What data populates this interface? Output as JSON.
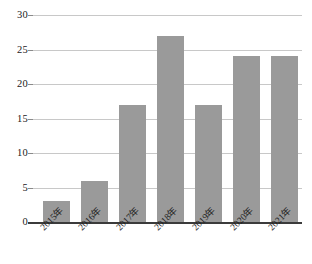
{
  "chart_data": {
    "type": "bar",
    "title": "",
    "subtitle": "",
    "xlabel": "",
    "ylabel": "",
    "categories": [
      "2015年",
      "2016年",
      "2017年",
      "2018年",
      "2019年",
      "2020年",
      "2021年"
    ],
    "values": [
      3,
      6,
      17,
      27,
      17,
      24,
      24
    ],
    "ylim": [
      0,
      30
    ],
    "ytick_labels": [
      "0",
      "5",
      "10",
      "15",
      "20",
      "25",
      "30"
    ],
    "ytick_values": [
      0,
      5,
      10,
      15,
      20,
      25,
      30
    ],
    "grid": "horizontal",
    "legend": "none",
    "series": [
      {
        "name": "",
        "values": [
          3,
          6,
          17,
          27,
          17,
          24,
          24
        ]
      }
    ],
    "annotations": [],
    "colors": {
      "bar_fill": "#9a9a9a",
      "gridline": "#c8c8c8",
      "axis_line": "#3b3b3b",
      "tick_label": "#1a1a1a",
      "background": "#ffffff"
    },
    "x_label_rotation_degrees": -45
  }
}
